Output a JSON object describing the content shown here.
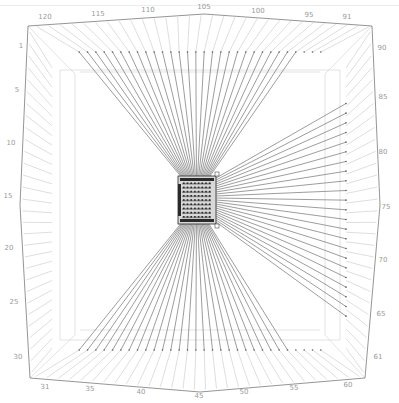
{
  "diagram": {
    "type": "pin-wirebond-package-view",
    "colors": {
      "frame": "#7a7a7a",
      "pad_lines": "#bdbdbd",
      "wires": "#5a5a5a",
      "inner_frame": "#d0d0d0",
      "chip_body": "#8c8c8c",
      "chip_dark": "#2a2a2a",
      "label": "#9a9a9a"
    },
    "pin_labels": {
      "top": [
        {
          "text": "120",
          "x": 45,
          "y": 19
        },
        {
          "text": "115",
          "x": 98,
          "y": 16
        },
        {
          "text": "110",
          "x": 148,
          "y": 12
        },
        {
          "text": "105",
          "x": 204,
          "y": 9
        },
        {
          "text": "100",
          "x": 258,
          "y": 13
        },
        {
          "text": "95",
          "x": 309,
          "y": 17
        },
        {
          "text": "91",
          "x": 347,
          "y": 19
        }
      ],
      "right": [
        {
          "text": "90",
          "x": 382,
          "y": 50
        },
        {
          "text": "85",
          "x": 383,
          "y": 99
        },
        {
          "text": "80",
          "x": 383,
          "y": 154
        },
        {
          "text": "75",
          "x": 386,
          "y": 209
        },
        {
          "text": "70",
          "x": 383,
          "y": 262
        },
        {
          "text": "65",
          "x": 381,
          "y": 316
        },
        {
          "text": "61",
          "x": 378,
          "y": 359
        }
      ],
      "bottom": [
        {
          "text": "60",
          "x": 348,
          "y": 387
        },
        {
          "text": "55",
          "x": 294,
          "y": 390
        },
        {
          "text": "50",
          "x": 244,
          "y": 394
        },
        {
          "text": "45",
          "x": 199,
          "y": 398
        },
        {
          "text": "40",
          "x": 141,
          "y": 394
        },
        {
          "text": "35",
          "x": 90,
          "y": 391
        },
        {
          "text": "31",
          "x": 45,
          "y": 389
        }
      ],
      "left": [
        {
          "text": "1",
          "x": 21,
          "y": 48
        },
        {
          "text": "5",
          "x": 17,
          "y": 92
        },
        {
          "text": "10",
          "x": 11,
          "y": 145
        },
        {
          "text": "15",
          "x": 8,
          "y": 198
        },
        {
          "text": "20",
          "x": 9,
          "y": 250
        },
        {
          "text": "25",
          "x": 14,
          "y": 304
        },
        {
          "text": "30",
          "x": 18,
          "y": 359
        }
      ]
    },
    "pins_per_side": {
      "top": 30,
      "right": 30,
      "bottom": 30,
      "left": 30
    },
    "chip_grid": {
      "rows": 9,
      "cols": 8
    }
  }
}
